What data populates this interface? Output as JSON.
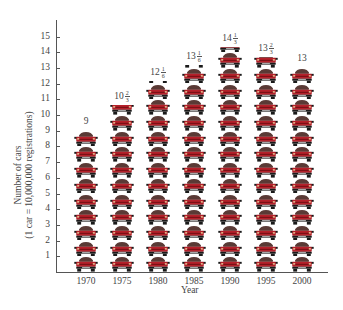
{
  "chart_data": {
    "type": "bar",
    "style": "pictograph",
    "title": "",
    "xlabel": "Year",
    "ylabel": "Number of cars",
    "ylabel_sub": "(1 car = 10,000,000 registrations)",
    "categories": [
      "1970",
      "1975",
      "1980",
      "1985",
      "1990",
      "1995",
      "2000"
    ],
    "values": [
      9,
      10.6667,
      12.1667,
      13.1667,
      14.3333,
      13.6667,
      13
    ],
    "value_labels": [
      {
        "whole": "9",
        "num": "",
        "den": ""
      },
      {
        "whole": "10",
        "num": "2",
        "den": "3"
      },
      {
        "whole": "12",
        "num": "1",
        "den": "6"
      },
      {
        "whole": "13",
        "num": "1",
        "den": "6"
      },
      {
        "whole": "14",
        "num": "1",
        "den": "3"
      },
      {
        "whole": "13",
        "num": "2",
        "den": "3"
      },
      {
        "whole": "13",
        "num": "",
        "den": ""
      }
    ],
    "yticks": [
      "1",
      "2",
      "3",
      "4",
      "5",
      "6",
      "7",
      "8",
      "9",
      "10",
      "11",
      "12",
      "13",
      "14",
      "15"
    ],
    "ylim": [
      0,
      16
    ],
    "grid": false,
    "legend": null,
    "unit_note": "1 car = 10,000,000 registrations"
  },
  "colors": {
    "car_body": "#b5202a",
    "car_roof": "#5a3a36",
    "car_bumper": "#1a1a1a",
    "axis": "#555555",
    "text": "#444444"
  }
}
